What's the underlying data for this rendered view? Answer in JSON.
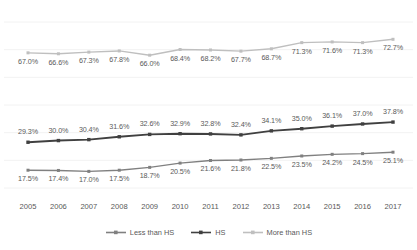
{
  "chart_data": {
    "type": "line",
    "title": "",
    "subtitle": "",
    "xlabel": "",
    "ylabel": "",
    "grid": true,
    "legend_position": "bottom",
    "ylim": [
      10,
      80
    ],
    "categories": [
      "2005",
      "2006",
      "2007",
      "2008",
      "2009",
      "2010",
      "2011",
      "2012",
      "2013",
      "2014",
      "2015",
      "2016",
      "2017"
    ],
    "x": [
      2005,
      2006,
      2007,
      2008,
      2009,
      2010,
      2011,
      2012,
      2013,
      2014,
      2015,
      2016,
      2017
    ],
    "series": [
      {
        "name": "Less than HS",
        "color": "#808080",
        "values": [
          17.5,
          17.4,
          17.0,
          17.5,
          18.7,
          20.5,
          21.6,
          21.8,
          22.5,
          23.5,
          24.2,
          24.5,
          25.1
        ],
        "labels": [
          "17.5%",
          "17.4%",
          "17.0%",
          "17.5%",
          "18.7%",
          "20.5%",
          "21.6%",
          "21.8%",
          "22.5%",
          "23.5%",
          "24.2%",
          "24.5%",
          "25.1%"
        ],
        "label_position": "below"
      },
      {
        "name": "HS",
        "color": "#404040",
        "values": [
          29.3,
          30.0,
          30.4,
          31.6,
          32.6,
          32.9,
          32.8,
          32.4,
          34.1,
          35.0,
          36.1,
          37.0,
          37.8
        ],
        "labels": [
          "29.3%",
          "30.0%",
          "30.4%",
          "31.6%",
          "32.6%",
          "32.9%",
          "32.8%",
          "32.4%",
          "34.1%",
          "35.0%",
          "36.1%",
          "37.0%",
          "37.8%"
        ],
        "label_position": "above"
      },
      {
        "name": "More than HS",
        "color": "#bfbfbf",
        "values": [
          67.0,
          66.6,
          67.3,
          67.8,
          66.0,
          68.4,
          68.2,
          67.7,
          68.7,
          71.3,
          71.6,
          71.3,
          72.7
        ],
        "labels": [
          "67.0%",
          "66.6%",
          "67.3%",
          "67.8%",
          "66.0%",
          "68.4%",
          "68.2%",
          "67.7%",
          "68.7%",
          "71.3%",
          "71.6%",
          "71.3%",
          "72.7%"
        ],
        "label_position": "below"
      }
    ],
    "gridline_color": "#f2f2f2",
    "label_text_color": "#595959"
  },
  "legend": {
    "items": [
      {
        "label": "Less than HS",
        "color": "#808080"
      },
      {
        "label": "HS",
        "color": "#404040"
      },
      {
        "label": "More than HS",
        "color": "#bfbfbf"
      }
    ]
  }
}
